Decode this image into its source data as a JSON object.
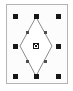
{
  "app": {
    "view_name": "vector-shape-selection",
    "canvas": {
      "width": 73,
      "height": 91,
      "background_color": "#ffffff"
    }
  },
  "selection": {
    "bounding_box": {
      "x": 6,
      "y": 4,
      "width": 62,
      "height": 80,
      "stroke_color": "#b4b4b4",
      "fill_color": "#fcfcfc",
      "stroke_width": 1
    },
    "handle_color": "#161616",
    "handle_size": 5,
    "handle_count": 8,
    "handles": [
      {
        "name": "handle-top-left",
        "cx": 15,
        "cy": 16,
        "cursor": "nwse-resize"
      },
      {
        "name": "handle-top-center",
        "cx": 36,
        "cy": 16,
        "cursor": "ns-resize"
      },
      {
        "name": "handle-top-right",
        "cx": 58,
        "cy": 16,
        "cursor": "nesw-resize"
      },
      {
        "name": "handle-middle-left",
        "cx": 15,
        "cy": 46,
        "cursor": "ew-resize"
      },
      {
        "name": "handle-middle-right",
        "cx": 58,
        "cy": 46,
        "cursor": "ew-resize"
      },
      {
        "name": "handle-bottom-left",
        "cx": 15,
        "cy": 76,
        "cursor": "nesw-resize"
      },
      {
        "name": "handle-bottom-center",
        "cx": 36,
        "cy": 76,
        "cursor": "ns-resize"
      },
      {
        "name": "handle-bottom-right",
        "cx": 58,
        "cy": 76,
        "cursor": "nwse-resize"
      }
    ]
  },
  "shape": {
    "label": "diamond",
    "type": "closed-path",
    "stroke_color": "#8c8c8c",
    "fill_color": "#ffffff",
    "stroke_width": 1,
    "path": "M 36 17 L 52 46 L 36 76 L 20 46 Z",
    "vertices": [
      {
        "name": "vertex-top",
        "x": 36,
        "y": 17
      },
      {
        "name": "vertex-right",
        "x": 52,
        "y": 46
      },
      {
        "name": "vertex-bottom",
        "x": 36,
        "y": 76
      },
      {
        "name": "vertex-left",
        "x": 20,
        "y": 46
      }
    ],
    "node_color": "#4d4d4d",
    "node_size": 3,
    "nodes": [
      {
        "name": "node-upper-left",
        "cx": 27,
        "cy": 32
      },
      {
        "name": "node-upper-right",
        "cx": 45,
        "cy": 32
      },
      {
        "name": "node-lower-right",
        "cx": 45,
        "cy": 61
      },
      {
        "name": "node-lower-left",
        "cx": 27,
        "cy": 61
      }
    ]
  },
  "center_marker": {
    "name": "rotation-center-marker",
    "glyph": "x",
    "cx": 36,
    "cy": 46,
    "size": 5,
    "color": "#161616"
  }
}
